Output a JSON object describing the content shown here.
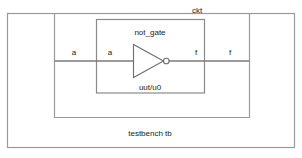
{
  "diagram": {
    "title_label": "ckt",
    "outer_label": "testbench tb",
    "gate_label": "not_gate",
    "instance_label": "uut/u0",
    "ports": {
      "tb_input": "a",
      "ckt_input": "a",
      "ckt_output": "f",
      "tb_output": "f"
    },
    "colors": {
      "background": "#ffffff",
      "box_stroke": "#9a9a9a",
      "wire_stroke": "#7a7a7a",
      "gate_stroke": "#6f6f6f",
      "text": "#1a1a1a"
    },
    "icons": {
      "not_gate": "inverter-triangle-icon",
      "bubble": "inversion-bubble-icon"
    }
  }
}
